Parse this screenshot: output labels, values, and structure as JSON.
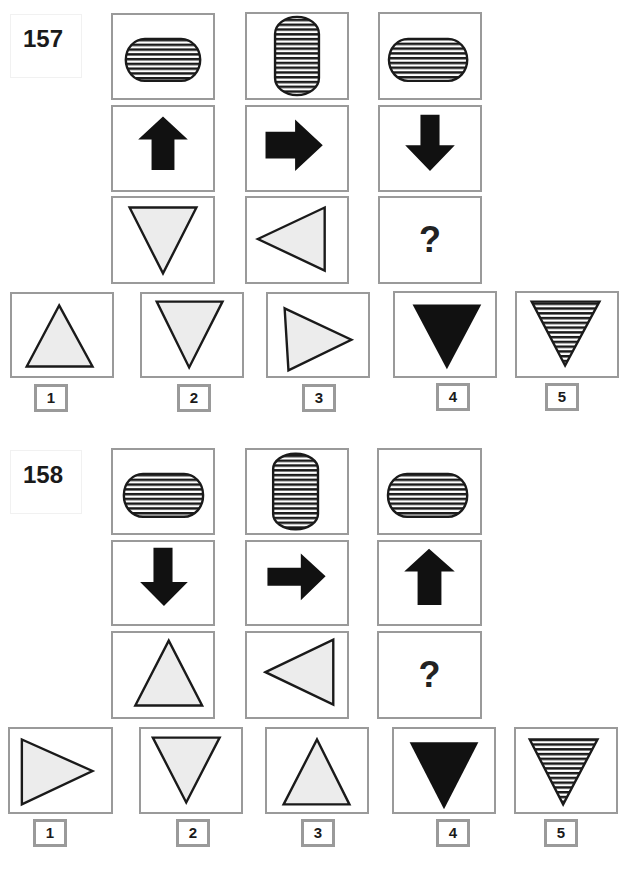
{
  "puzzles": [
    {
      "number": "157",
      "grid": [
        [
          "horizontal-striped-capsule",
          "vertical-striped-capsule",
          "horizontal-striped-capsule"
        ],
        [
          "arrow-up",
          "arrow-right",
          "arrow-down"
        ],
        [
          "triangle-down-light",
          "triangle-left-light",
          "?"
        ]
      ],
      "question_mark": "?",
      "options": [
        {
          "label": "1",
          "shape": "triangle-up-light"
        },
        {
          "label": "2",
          "shape": "triangle-down-light"
        },
        {
          "label": "3",
          "shape": "triangle-right-light"
        },
        {
          "label": "4",
          "shape": "triangle-down-black"
        },
        {
          "label": "5",
          "shape": "triangle-down-striped"
        }
      ]
    },
    {
      "number": "158",
      "grid": [
        [
          "horizontal-striped-capsule",
          "vertical-striped-capsule",
          "horizontal-striped-capsule"
        ],
        [
          "arrow-down",
          "arrow-right",
          "arrow-up"
        ],
        [
          "triangle-up-light",
          "triangle-left-light",
          "?"
        ]
      ],
      "question_mark": "?",
      "options": [
        {
          "label": "1",
          "shape": "triangle-right-light"
        },
        {
          "label": "2",
          "shape": "triangle-down-light"
        },
        {
          "label": "3",
          "shape": "triangle-up-light"
        },
        {
          "label": "4",
          "shape": "triangle-down-black"
        },
        {
          "label": "5",
          "shape": "triangle-down-striped"
        }
      ]
    }
  ],
  "colors": {
    "border": "#9a9a9a",
    "shape_fill_light": "#ececec",
    "shape_stroke": "#1a1a1a"
  }
}
